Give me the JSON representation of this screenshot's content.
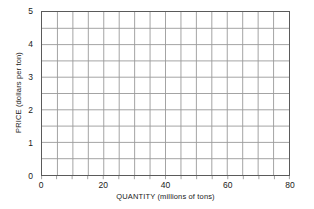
{
  "chart_data": {
    "type": "line",
    "title": "",
    "subtitle": "",
    "xlabel": "QUANTITY  (millions of tons)",
    "ylabel": "PRICE  (dollars per ton)",
    "xlim": [
      0,
      80
    ],
    "ylim": [
      0,
      5
    ],
    "grid": true,
    "legend": null,
    "series": [],
    "annotations": [],
    "x_ticks": [
      {
        "value": 0,
        "label": "0"
      },
      {
        "value": 20,
        "label": "20"
      },
      {
        "value": 40,
        "label": "40"
      },
      {
        "value": 60,
        "label": "60"
      },
      {
        "value": 80,
        "label": "80"
      }
    ],
    "y_ticks": [
      {
        "value": 0,
        "label": "0"
      },
      {
        "value": 1,
        "label": "1"
      },
      {
        "value": 2,
        "label": "2"
      },
      {
        "value": 3,
        "label": "3"
      },
      {
        "value": 4,
        "label": "4"
      },
      {
        "value": 5,
        "label": "5"
      }
    ],
    "x_gridline_step": 5,
    "y_gridline_step": 0.5,
    "x_gridline_values": [
      0,
      5,
      10,
      15,
      20,
      25,
      30,
      35,
      40,
      45,
      50,
      55,
      60,
      65,
      70,
      75,
      80
    ],
    "y_gridline_values": [
      0,
      0.5,
      1,
      1.5,
      2,
      2.5,
      3,
      3.5,
      4,
      4.5,
      5
    ],
    "colors": {
      "background": "#ffffff",
      "plot_border": "#5a5a5a",
      "gridline": "#9a9a9a",
      "text": "#1a1a1a"
    }
  }
}
